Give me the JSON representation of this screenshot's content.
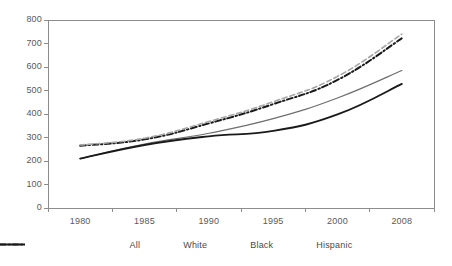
{
  "chart_data": {
    "type": "line",
    "title": "",
    "xlabel": "",
    "ylabel": "",
    "x": [
      1980,
      1985,
      1990,
      1995,
      2000,
      2008
    ],
    "categories": [
      "1980",
      "1985",
      "1990",
      "1995",
      "2000",
      "2008"
    ],
    "xtick_labels": [
      "1980",
      "1985",
      "1990",
      "1995",
      "2000",
      "2008"
    ],
    "ytick_labels": [
      "0",
      "100",
      "200",
      "300",
      "400",
      "500",
      "600",
      "700",
      "800"
    ],
    "yticks": [
      0,
      100,
      200,
      300,
      400,
      500,
      600,
      700,
      800
    ],
    "ylim": [
      0,
      800
    ],
    "grid": false,
    "legend_position": "bottom",
    "series": [
      {
        "name": "All",
        "values": [
          265,
          292,
          360,
          442,
          545,
          722
        ],
        "style": "dash-dot",
        "color": "#1a1a1a",
        "width": 2
      },
      {
        "name": "White",
        "values": [
          268,
          297,
          368,
          452,
          560,
          740
        ],
        "style": "dashed",
        "color": "#a6a6a6",
        "width": 1.6
      },
      {
        "name": "Black",
        "values": [
          210,
          272,
          318,
          380,
          468,
          585
        ],
        "style": "solid",
        "color": "#6e6e6e",
        "width": 1.2
      },
      {
        "name": "Hispanic",
        "values": [
          210,
          268,
          305,
          328,
          398,
          528
        ],
        "style": "solid",
        "color": "#1a1a1a",
        "width": 1.9
      }
    ]
  },
  "legend": {
    "items": [
      {
        "label": "All"
      },
      {
        "label": "White"
      },
      {
        "label": "Black"
      },
      {
        "label": "Hispanic"
      }
    ]
  },
  "axes": {
    "frame_color": "#8c8c8c",
    "tick_color": "#8c8c8c",
    "label_color": "#595959"
  }
}
